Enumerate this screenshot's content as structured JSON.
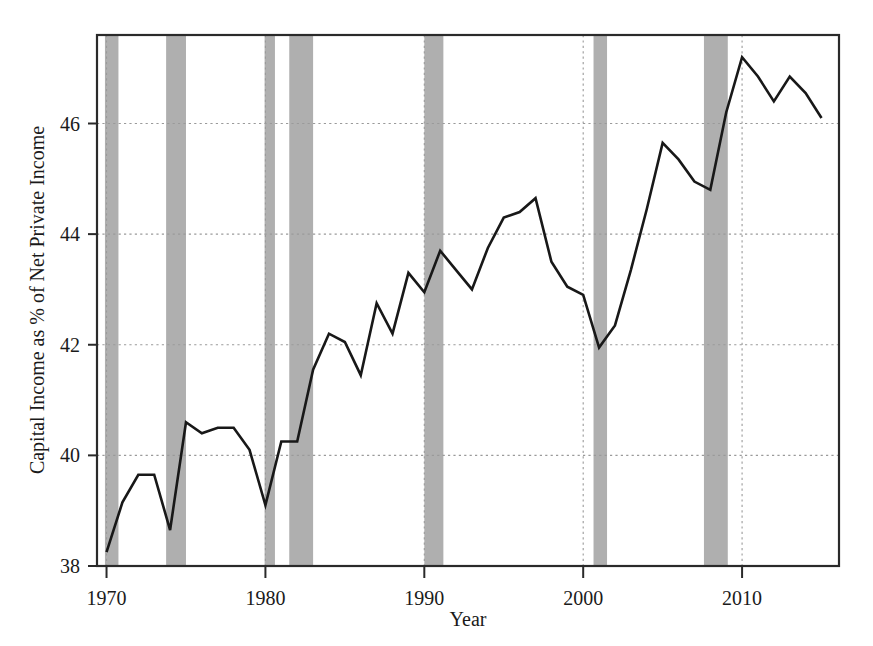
{
  "chart_data": {
    "type": "line",
    "title": "",
    "xlabel": "Year",
    "ylabel": "Capital Income as % of Net Private Income",
    "xlim": [
      1969.4,
      2016.1
    ],
    "ylim": [
      38.0,
      47.6
    ],
    "xticks": [
      1970,
      1980,
      1990,
      2000,
      2010
    ],
    "xtick_labels": [
      "1970",
      "1980",
      "1990",
      "2000",
      "2010"
    ],
    "yticks": [
      38,
      40,
      42,
      44,
      46
    ],
    "ytick_labels": [
      "38",
      "40",
      "42",
      "44",
      "46"
    ],
    "grid": true,
    "legend": "none",
    "line_color": "#181818",
    "band_color": "#a8a8a8",
    "series": [
      {
        "name": "Capital Income as % of Net Private Income",
        "x": [
          1970,
          1971,
          1972,
          1973,
          1974,
          1975,
          1976,
          1977,
          1978,
          1979,
          1980,
          1981,
          1982,
          1983,
          1984,
          1985,
          1986,
          1987,
          1988,
          1989,
          1990,
          1991,
          1992,
          1993,
          1994,
          1995,
          1996,
          1997,
          1998,
          1999,
          2000,
          2001,
          2002,
          2003,
          2004,
          2005,
          2006,
          2007,
          2008,
          2009,
          2010,
          2011,
          2012,
          2013,
          2014,
          2015
        ],
        "values": [
          38.25,
          39.15,
          39.65,
          39.65,
          38.65,
          40.6,
          40.4,
          40.5,
          40.5,
          40.1,
          39.1,
          40.25,
          40.25,
          41.55,
          42.2,
          42.05,
          41.45,
          42.75,
          42.2,
          43.3,
          42.95,
          43.7,
          43.35,
          43.0,
          43.75,
          44.3,
          44.4,
          44.65,
          43.5,
          43.05,
          42.9,
          41.95,
          42.35,
          43.35,
          44.45,
          45.65,
          45.35,
          44.95,
          44.8,
          46.2,
          47.2,
          46.85,
          46.4,
          46.85,
          46.55,
          46.1
        ],
        "units": "% of net private income"
      }
    ],
    "recession_bands": [
      {
        "label": "1969-1970 recession",
        "start": 1969.9,
        "end": 1970.75
      },
      {
        "label": "1973-1975 recession",
        "start": 1973.75,
        "end": 1975.0
      },
      {
        "label": "1980 recession",
        "start": 1979.95,
        "end": 1980.6
      },
      {
        "label": "1981-1982 recession",
        "start": 1981.5,
        "end": 1983.0
      },
      {
        "label": "1990-1991 recession",
        "start": 1990.0,
        "end": 1991.2
      },
      {
        "label": "2001 recession",
        "start": 2000.65,
        "end": 2001.5
      },
      {
        "label": "2007-2009 recession",
        "start": 2007.6,
        "end": 2009.1
      }
    ]
  }
}
